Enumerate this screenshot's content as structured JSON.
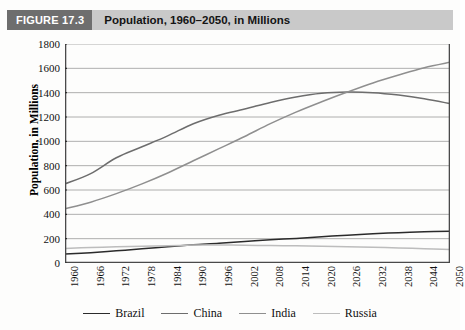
{
  "header": {
    "figure_tag": "FIGURE 17.3",
    "title": "Population, 1960–2050, in Millions"
  },
  "axis": {
    "ylabel": "Population, in Millions",
    "xlabel": ""
  },
  "chart_data": {
    "type": "line",
    "title": "Population, 1960–2050, in Millions",
    "xlabel": "",
    "ylabel": "Population, in Millions",
    "xlim": [
      1960,
      2050
    ],
    "ylim": [
      0,
      1800
    ],
    "ytick_values": [
      0,
      200,
      400,
      600,
      800,
      1000,
      1200,
      1400,
      1600,
      1800
    ],
    "ytick_labels": [
      "0",
      "200",
      "400",
      "600",
      "800",
      "1000",
      "1200",
      "1400",
      "1600",
      "1800"
    ],
    "x": [
      1960,
      1966,
      1972,
      1978,
      1984,
      1990,
      1996,
      2002,
      2008,
      2014,
      2020,
      2026,
      2032,
      2038,
      2044,
      2050
    ],
    "xtick_labels": [
      "1960",
      "1966",
      "1972",
      "1978",
      "1984",
      "1990",
      "1996",
      "2002",
      "2008",
      "2014",
      "2020",
      "2026",
      "2032",
      "2038",
      "2044",
      "2050"
    ],
    "grid": true,
    "grid_axis": "y",
    "legend_position": "bottom",
    "series": [
      {
        "name": "Brazil",
        "color": "#2b2b2b",
        "values": [
          73,
          85,
          100,
          117,
          134,
          150,
          162,
          177,
          191,
          202,
          216,
          228,
          240,
          249,
          256,
          261
        ]
      },
      {
        "name": "China",
        "color": "#6d6d6d",
        "values": [
          650,
          735,
          865,
          955,
          1045,
          1145,
          1215,
          1265,
          1320,
          1365,
          1395,
          1405,
          1400,
          1380,
          1350,
          1310
        ]
      },
      {
        "name": "India",
        "color": "#8f8f8f",
        "values": [
          445,
          500,
          570,
          650,
          740,
          840,
          940,
          1040,
          1145,
          1240,
          1325,
          1405,
          1480,
          1545,
          1605,
          1650
        ]
      },
      {
        "name": "Russia",
        "color": "#bdbdbd",
        "values": [
          120,
          127,
          133,
          138,
          142,
          147,
          148,
          146,
          143,
          141,
          138,
          134,
          129,
          124,
          117,
          110
        ]
      }
    ]
  },
  "legend": {
    "entries": [
      {
        "label": "Brazil",
        "color": "#2b2b2b"
      },
      {
        "label": "China",
        "color": "#6d6d6d"
      },
      {
        "label": "India",
        "color": "#8f8f8f"
      },
      {
        "label": "Russia",
        "color": "#bdbdbd"
      }
    ]
  }
}
